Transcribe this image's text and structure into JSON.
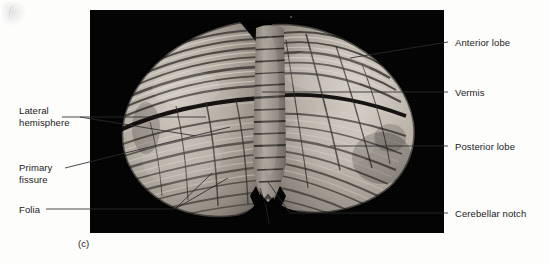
{
  "figure": {
    "caption": "(c)",
    "background_color": "#fdfdfb",
    "photo_background_color": "#030303"
  },
  "labels": {
    "lateral_hemisphere": "Lateral\nhemisphere",
    "primary_fissure": "Primary\nfissure",
    "folia": "Folia",
    "anterior_lobe": "Anterior lobe",
    "vermis": "Vermis",
    "posterior_lobe": "Posterior lobe",
    "cerebellar_notch": "Cerebellar notch"
  }
}
